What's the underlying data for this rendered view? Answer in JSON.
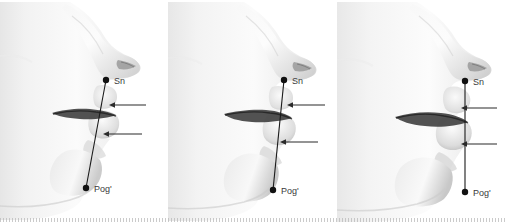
{
  "figure": {
    "panel_count": 3,
    "line_name": "Sn-Pog'",
    "colors": {
      "line": "#1a1a1a",
      "point": "#111111",
      "arrow": "#2b2b2b",
      "label_text": "#3a3a3a",
      "skin_light": "#fdfdfd",
      "skin_mid": "#e3e3e3",
      "skin_shadow": "#b5b5b5",
      "skin_dark": "#8c8c8c",
      "background": "#ffffff",
      "baseline": "#b9b9b9"
    }
  },
  "panels": [
    {
      "id": "panel-0",
      "name": "profile-retruded-lips",
      "labels": {
        "upper_point": "Sn",
        "lower_point": "Pog'"
      },
      "points": {
        "sn": {
          "x": 106,
          "y": 80
        },
        "pog": {
          "x": 86,
          "y": 188
        }
      },
      "arrows": [
        {
          "name": "upper-lip-arrow",
          "tip_x": 110,
          "tip_y": 105,
          "tail_x": 146,
          "tail_y": 105
        },
        {
          "name": "lower-lip-arrow",
          "tip_x": 104,
          "tip_y": 134,
          "tail_x": 142,
          "tail_y": 134
        }
      ],
      "label_positions": {
        "sn": {
          "x": 114,
          "y": 84
        },
        "pog": {
          "x": 94,
          "y": 192
        }
      }
    },
    {
      "id": "panel-1",
      "name": "profile-balanced-lips",
      "labels": {
        "upper_point": "Sn",
        "lower_point": "Pog'"
      },
      "points": {
        "sn": {
          "x": 116,
          "y": 80
        },
        "pog": {
          "x": 105,
          "y": 190
        }
      },
      "arrows": [
        {
          "name": "upper-lip-arrow",
          "tip_x": 120,
          "tip_y": 105,
          "tail_x": 157,
          "tail_y": 105
        },
        {
          "name": "lower-lip-arrow",
          "tip_x": 113,
          "tip_y": 142,
          "tail_x": 150,
          "tail_y": 142
        }
      ],
      "label_positions": {
        "sn": {
          "x": 124,
          "y": 84
        },
        "pog": {
          "x": 113,
          "y": 194
        }
      }
    },
    {
      "id": "panel-2",
      "name": "profile-protruded-lips",
      "labels": {
        "upper_point": "Sn",
        "lower_point": "Pog'"
      },
      "points": {
        "sn": {
          "x": 128,
          "y": 81
        },
        "pog": {
          "x": 128,
          "y": 192
        }
      },
      "arrows": [
        {
          "name": "upper-lip-arrow",
          "tip_x": 124,
          "tip_y": 108,
          "tail_x": 160,
          "tail_y": 108
        },
        {
          "name": "lower-lip-arrow",
          "tip_x": 124,
          "tip_y": 144,
          "tail_x": 160,
          "tail_y": 144
        }
      ],
      "label_positions": {
        "sn": {
          "x": 136,
          "y": 85
        },
        "pog": {
          "x": 136,
          "y": 196
        }
      }
    }
  ]
}
